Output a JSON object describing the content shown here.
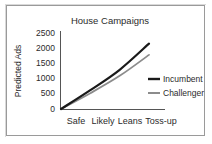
{
  "chart_data": {
    "type": "line",
    "title": "House Campaigns",
    "xlabel": "",
    "ylabel": "Predicted Ads",
    "categories": [
      "Safe",
      "Likely",
      "Leans",
      "Toss-up"
    ],
    "x": [
      0,
      1,
      2,
      3
    ],
    "ylim": [
      0,
      2500
    ],
    "yticks": [
      0,
      500,
      1000,
      1500,
      2000,
      2500
    ],
    "ytick_labels": [
      "0",
      "500",
      "1000",
      "1500",
      "2000",
      "2500"
    ],
    "grid": false,
    "legend_position": "center-right",
    "series": [
      {
        "name": "Incumbent",
        "color": "#1a1a1a",
        "linewidth": 2.2,
        "values": [
          0,
          620,
          1290,
          2150
        ]
      },
      {
        "name": "Challenger",
        "color": "#8c8c8c",
        "linewidth": 1.8,
        "values": [
          0,
          520,
          1090,
          1780
        ]
      }
    ]
  },
  "colors": {
    "incumbent": "#1a1a1a",
    "challenger": "#8c8c8c",
    "axis": "#555555",
    "frame": "#9a9a9a",
    "background": "#ffffff",
    "text": "#2b2b2b"
  }
}
